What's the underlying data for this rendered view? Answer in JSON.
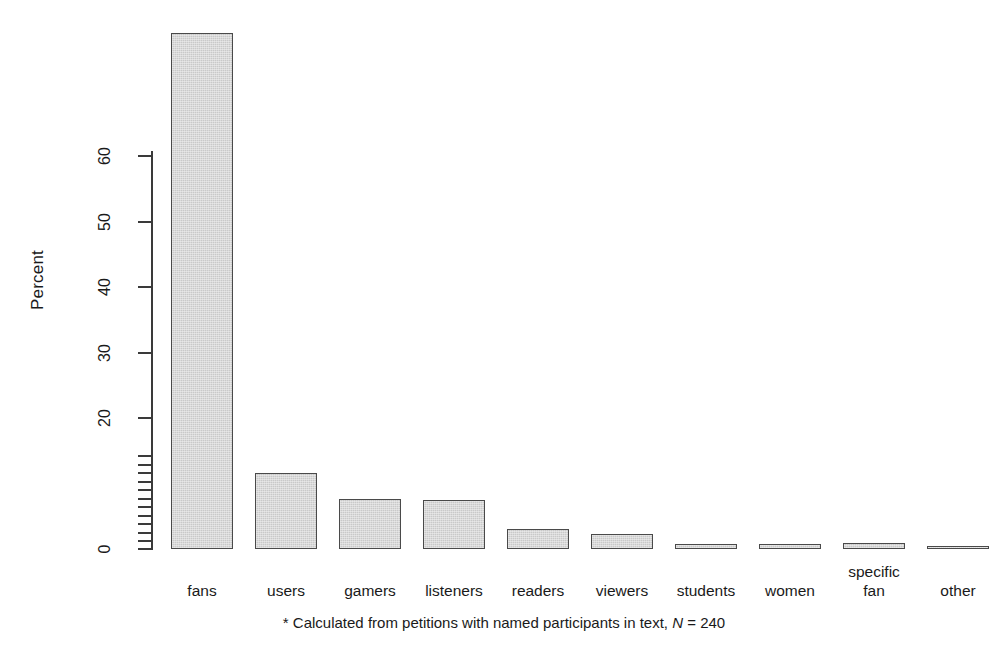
{
  "chart_data": {
    "type": "bar",
    "title": "",
    "subtitle": "",
    "xlabel": "",
    "ylabel": "Percent",
    "categories": [
      "fans",
      "users",
      "gamers",
      "listeners",
      "readers",
      "viewers",
      "students",
      "women",
      "specific\nfan",
      "other"
    ],
    "values": [
      78.8,
      11.6,
      7.6,
      7.5,
      3.1,
      2.3,
      0.8,
      0.8,
      0.9,
      0.3
    ],
    "ylim": [
      0,
      80
    ],
    "grid": false,
    "legend": null,
    "axis_major_ticks": [
      0,
      20,
      30,
      40,
      50,
      60
    ],
    "axis_minor_ticks": [
      1.2,
      2.5,
      3.8,
      5.1,
      6.4,
      7.7,
      9.0,
      10.3,
      11.6,
      12.9,
      14.2
    ],
    "bar_fill_color": "#c9c9c9",
    "bar_border_color": "#4a4a4a",
    "annotation": {
      "marker": "*",
      "text_before_n": " Calculated from petitions with named participants in text, ",
      "n_symbol": "N",
      "n_value": " = 240"
    }
  }
}
